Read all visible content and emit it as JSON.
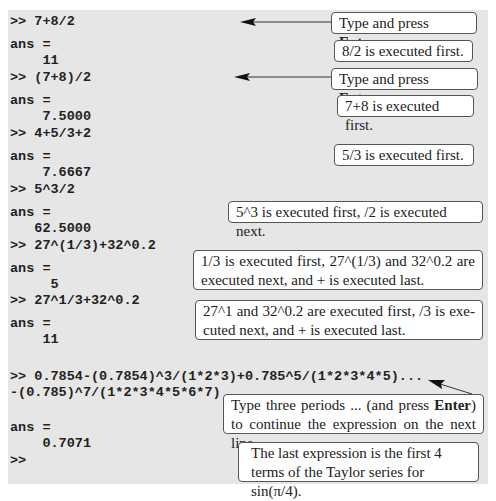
{
  "console": {
    "lines": [
      {
        "type": "cmd",
        "text": ">> 7+8/2"
      },
      {
        "type": "label",
        "text": "ans ="
      },
      {
        "type": "value",
        "text": "    11"
      },
      {
        "type": "cmd",
        "text": ">> (7+8)/2"
      },
      {
        "type": "label",
        "text": "ans ="
      },
      {
        "type": "value",
        "text": "    7.5000"
      },
      {
        "type": "cmd",
        "text": ">> 4+5/3+2"
      },
      {
        "type": "label",
        "text": "ans ="
      },
      {
        "type": "value",
        "text": "    7.6667"
      },
      {
        "type": "cmd",
        "text": ">> 5^3/2"
      },
      {
        "type": "label",
        "text": "ans ="
      },
      {
        "type": "value",
        "text": "   62.5000"
      },
      {
        "type": "cmd",
        "text": ">> 27^(1/3)+32^0.2"
      },
      {
        "type": "label",
        "text": "ans ="
      },
      {
        "type": "value",
        "text": "     5"
      },
      {
        "type": "cmd",
        "text": ">> 27^1/3+32^0.2"
      },
      {
        "type": "label",
        "text": "ans ="
      },
      {
        "type": "value",
        "text": "    11"
      },
      {
        "type": "cmd",
        "text": ">> 0.7854-(0.7854)^3/(1*2*3)+0.785^5/(1*2*3*4*5)..."
      },
      {
        "type": "cmd",
        "text": "-(0.785)^7/(1*2*3*4*5*6*7)"
      },
      {
        "type": "label",
        "text": "ans ="
      },
      {
        "type": "value",
        "text": "    0.7071"
      },
      {
        "type": "prompt",
        "text": ">>"
      }
    ]
  },
  "notes": {
    "n1": {
      "pre": "Type and press ",
      "bold": "Enter",
      "post": "."
    },
    "n2": {
      "text": "8/2 is executed first."
    },
    "n3": {
      "pre": "Type and press ",
      "bold": "Enter",
      "post": "."
    },
    "n4": {
      "text": "7+8 is executed first."
    },
    "n5": {
      "text": "5/3 is executed first."
    },
    "n6": {
      "text": "5^3 is executed first, /2 is executed next."
    },
    "n7": {
      "text": "1/3 is executed first, 27^(1/3) and 32^0.2 are executed next, and + is executed last."
    },
    "n8": {
      "text": "27^1 and 32^0.2 are executed first, /3 is exe-cuted next, and + is executed last."
    },
    "n9": {
      "pre": "Type three periods ... (and press ",
      "bold": "Enter",
      "post": ") to continue the expression on the next line."
    },
    "n10": {
      "text": "The last expression is the first 4 terms of the Taylor series for sin(π/4)."
    }
  }
}
